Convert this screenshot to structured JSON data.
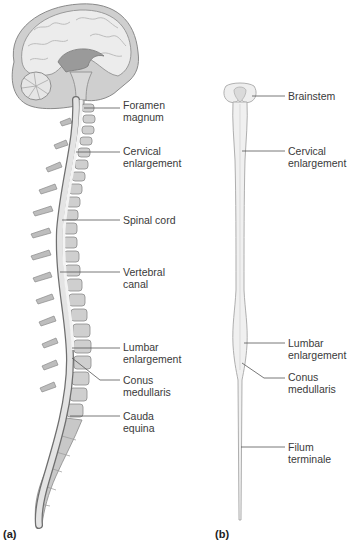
{
  "panels": [
    {
      "id": "a",
      "label": "(a)"
    },
    {
      "id": "b",
      "label": "(b)"
    }
  ],
  "labels_a": [
    {
      "text": "Foramen\nmagnum",
      "x": 123,
      "y": 99,
      "line_from": [
        84,
        108
      ],
      "line_to": [
        120,
        108
      ]
    },
    {
      "text": "Cervical\nenlargement",
      "x": 123,
      "y": 145,
      "line_from": [
        76,
        152
      ],
      "line_to": [
        120,
        152
      ]
    },
    {
      "text": "Spinal cord",
      "x": 123,
      "y": 213,
      "line_from": [
        56,
        220
      ],
      "line_to": [
        120,
        220
      ]
    },
    {
      "text": "Vertebral\ncanal",
      "x": 123,
      "y": 266,
      "line_from": [
        58,
        272
      ],
      "line_to": [
        120,
        272
      ]
    },
    {
      "text": "Lumbar\nenlargement",
      "x": 123,
      "y": 341,
      "line_from": [
        70,
        348
      ],
      "line_to": [
        120,
        348
      ]
    },
    {
      "text": "Conus\nmedullaris",
      "x": 123,
      "y": 374,
      "line_from": [
        72,
        358
      ],
      "line_to": [
        100,
        380
      ],
      "line_to2": [
        120,
        380
      ]
    },
    {
      "text": "Cauda\nequina",
      "x": 123,
      "y": 410,
      "line_from": [
        70,
        416
      ],
      "line_to": [
        120,
        416
      ]
    }
  ],
  "labels_b": [
    {
      "text": "Brainstem",
      "x": 288,
      "y": 89,
      "line_from": [
        253,
        96
      ],
      "line_to": [
        285,
        96
      ]
    },
    {
      "text": "Cervical\nenlargement",
      "x": 288,
      "y": 145,
      "line_from": [
        240,
        151
      ],
      "line_to": [
        285,
        151
      ]
    },
    {
      "text": "Lumbar\nenlargement",
      "x": 288,
      "y": 337,
      "line_from": [
        240,
        343
      ],
      "line_to": [
        285,
        343
      ]
    },
    {
      "text": "Conus\nmedullaris",
      "x": 288,
      "y": 371,
      "line_from": [
        241,
        363
      ],
      "line_to": [
        264,
        378
      ],
      "line_to2": [
        285,
        378
      ]
    },
    {
      "text": "Filum\nterminale",
      "x": 288,
      "y": 442,
      "line_from": [
        240,
        447
      ],
      "line_to": [
        285,
        447
      ]
    }
  ]
}
